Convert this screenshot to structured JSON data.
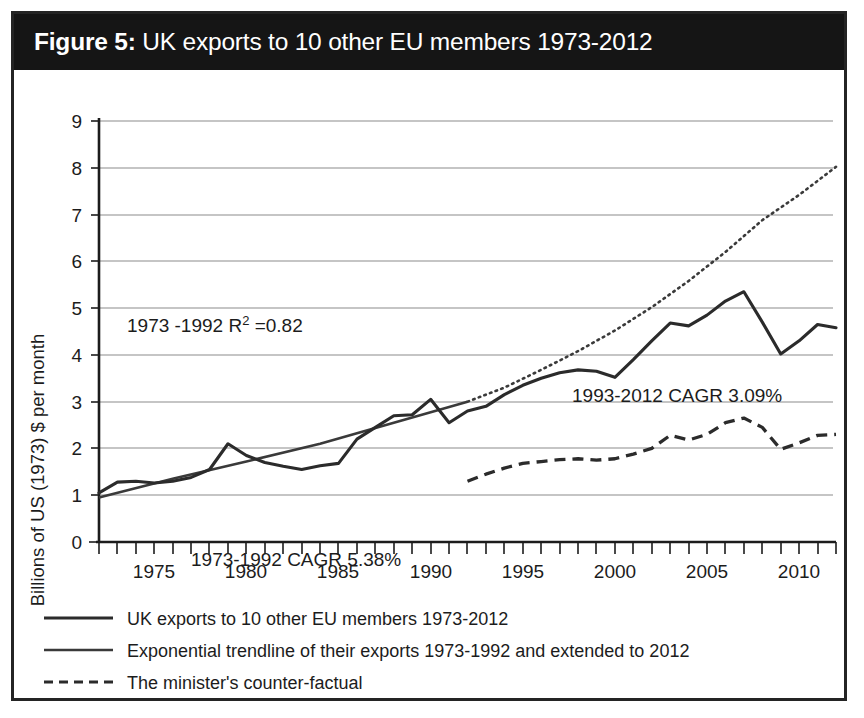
{
  "figure": {
    "label": "Figure 5:",
    "title": "UK exports to 10 other EU members 1973-2012"
  },
  "chart_data": {
    "type": "line",
    "title": "UK exports to 10 other EU members 1973-2012",
    "xlabel": "",
    "ylabel": "Billions of US (1973) $ per month",
    "xlim": [
      1972,
      2012
    ],
    "ylim": [
      0,
      9
    ],
    "grid": true,
    "legend_position": "below-plot",
    "xticks": [
      1975,
      1980,
      1985,
      1990,
      1995,
      2000,
      2005,
      2010
    ],
    "xtick_labels": [
      "1975",
      "1980",
      "1985",
      "1990",
      "1995",
      "2000",
      "2005",
      "2010"
    ],
    "xtick_minor_every": 1,
    "yticks": [
      0,
      1,
      2,
      3,
      4,
      5,
      6,
      7,
      8,
      9
    ],
    "ytick_labels": [
      "0",
      "1",
      "2",
      "3",
      "4",
      "5",
      "6",
      "7",
      "8",
      "9"
    ],
    "annotations": [
      {
        "text": "1973 -1992 R² =0.82",
        "x": 1974.0,
        "y": 4.45
      },
      {
        "text": "1973-1992 CAGR 5.38%",
        "x": 1976.2,
        "y": 0.72
      },
      {
        "text": "1993-2012 CAGR 3.09%",
        "x": 1998.6,
        "y": 3.28
      }
    ],
    "series": [
      {
        "name": "UK exports to 10 other EU members 1973-2012",
        "style": "solid",
        "x": [
          1972,
          1973,
          1974,
          1975,
          1976,
          1977,
          1978,
          1979,
          1980,
          1981,
          1982,
          1983,
          1984,
          1985,
          1986,
          1987,
          1988,
          1989,
          1990,
          1991,
          1992,
          1993,
          1994,
          1995,
          1996,
          1997,
          1998,
          1999,
          2000,
          2001,
          2002,
          2003,
          2004,
          2005,
          2006,
          2007,
          2008,
          2009,
          2010,
          2011,
          2012
        ],
        "values": [
          1.05,
          1.28,
          1.3,
          1.26,
          1.3,
          1.38,
          1.55,
          2.1,
          1.85,
          1.7,
          1.62,
          1.55,
          1.63,
          1.68,
          2.2,
          2.45,
          2.7,
          2.72,
          3.05,
          2.55,
          2.8,
          2.9,
          3.15,
          3.35,
          3.5,
          3.62,
          3.68,
          3.65,
          3.52,
          3.9,
          4.3,
          4.68,
          4.62,
          4.85,
          5.15,
          5.35,
          4.7,
          4.02,
          4.3,
          4.65,
          4.58
        ]
      },
      {
        "name": "Exponential trendline of their exports 1973-1992 (fitted segment)",
        "style": "solid",
        "x": [
          1972,
          1976,
          1980,
          1984,
          1988,
          1992
        ],
        "values": [
          0.95,
          1.35,
          1.72,
          2.1,
          2.55,
          3.0
        ]
      },
      {
        "name": "Exponential trendline extended to 2012",
        "style": "dotted",
        "x": [
          1992,
          1994,
          1996,
          1998,
          2000,
          2002,
          2004,
          2006,
          2008,
          2010,
          2012
        ],
        "values": [
          3.0,
          3.3,
          3.68,
          4.08,
          4.52,
          5.02,
          5.58,
          6.2,
          6.88,
          7.42,
          8.02
        ]
      },
      {
        "name": "The minister's counter-factual",
        "style": "dashed",
        "x": [
          1992,
          1993,
          1994,
          1995,
          1996,
          1997,
          1998,
          1999,
          2000,
          2001,
          2002,
          2003,
          2004,
          2005,
          2006,
          2007,
          2008,
          2009,
          2010,
          2011,
          2012
        ],
        "values": [
          1.3,
          1.45,
          1.58,
          1.68,
          1.72,
          1.76,
          1.78,
          1.75,
          1.78,
          1.88,
          2.0,
          2.28,
          2.18,
          2.3,
          2.55,
          2.65,
          2.45,
          1.98,
          2.12,
          2.28,
          2.3
        ]
      }
    ]
  },
  "legend": {
    "items": [
      {
        "label": "UK exports to 10 other EU members 1973-2012",
        "style": "solid-thick"
      },
      {
        "label": "Exponential trendline of their exports 1973-1992 and extended to 2012",
        "style": "solid-thin"
      },
      {
        "label": "The minister's counter-factual",
        "style": "dashed"
      }
    ]
  }
}
